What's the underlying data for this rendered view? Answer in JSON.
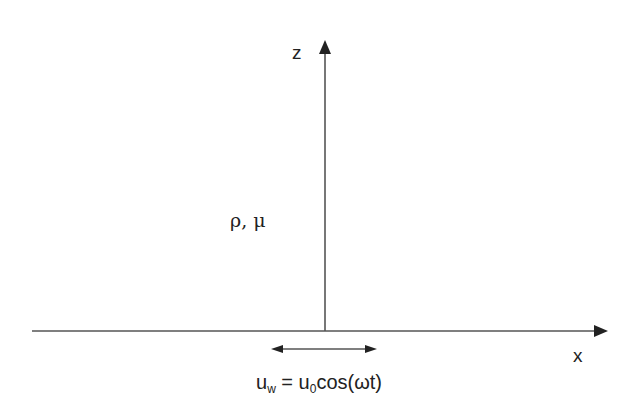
{
  "diagram": {
    "axes": {
      "z_label": "z",
      "x_label": "x"
    },
    "properties_label": "ρ, μ",
    "wall_velocity": {
      "lhs_base": "u",
      "lhs_sub": "w",
      "equals": " = ",
      "rhs_base": "u",
      "rhs_sub": "0",
      "rhs_rest": "cos(ωt)"
    },
    "colors": {
      "line": "#555555",
      "text": "#222222",
      "background": "#ffffff"
    }
  }
}
